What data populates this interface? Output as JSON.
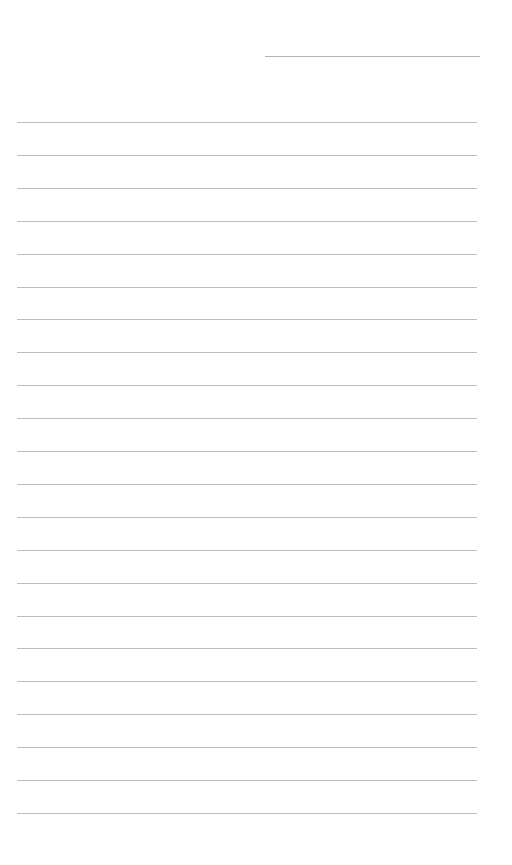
{
  "document": {
    "type": "lined-paper",
    "header": {
      "name_field_value": ""
    },
    "line_color": "#bdbdbd",
    "first_line_y": 122,
    "line_spacing": 32.9,
    "line_count": 22,
    "lines": [
      "",
      "",
      "",
      "",
      "",
      "",
      "",
      "",
      "",
      "",
      "",
      "",
      "",
      "",
      "",
      "",
      "",
      "",
      "",
      "",
      "",
      ""
    ]
  }
}
